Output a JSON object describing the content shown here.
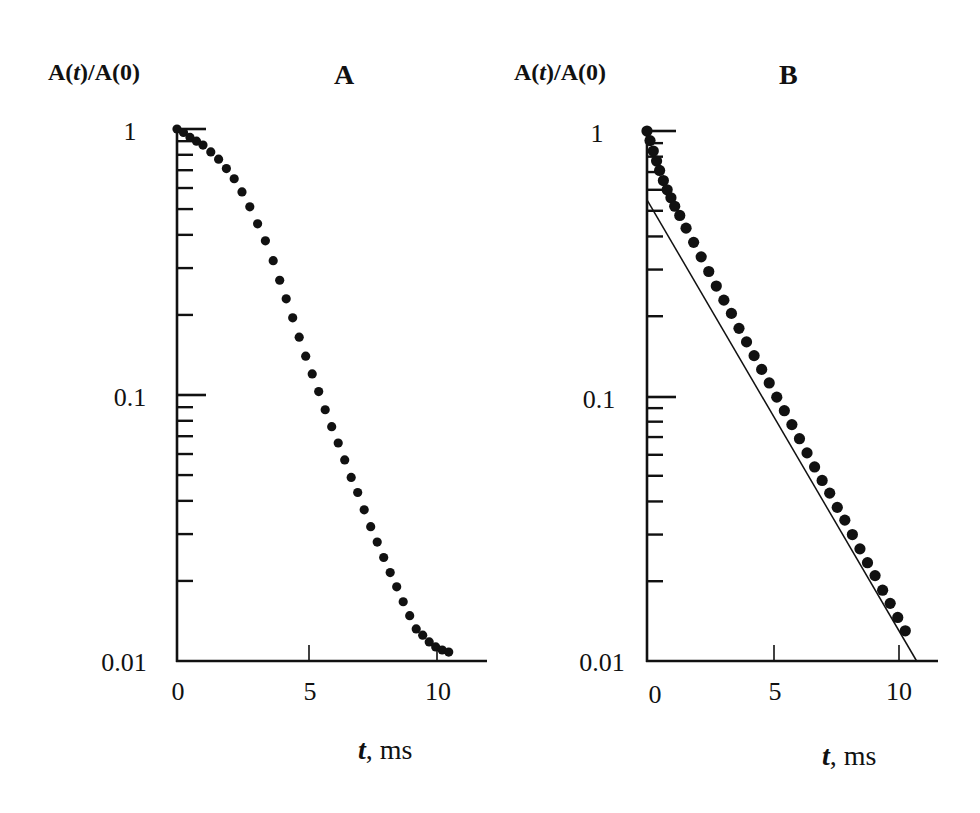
{
  "figure": {
    "panels": [
      {
        "id": "A",
        "title": "A",
        "ylabel_prefix": "A(",
        "ylabel_var": "t",
        "ylabel_suffix": ")/A(0)",
        "xlabel_var": "t",
        "xlabel_unit": ", ms",
        "yticks": [
          "1",
          "0.1",
          "0.01"
        ],
        "xticks": [
          "0",
          "5",
          "10"
        ]
      },
      {
        "id": "B",
        "title": "B",
        "ylabel_prefix": "A(",
        "ylabel_var": "t",
        "ylabel_suffix": ")/A(0)",
        "xlabel_var": "t",
        "xlabel_unit": ", ms",
        "yticks": [
          "1",
          "0.1",
          "0.01"
        ],
        "xticks": [
          "0",
          "5",
          "10"
        ]
      }
    ]
  },
  "chart_data": [
    {
      "type": "scatter",
      "title": "A",
      "xlabel": "t, ms",
      "ylabel": "A(t)/A(0)",
      "yscale": "log",
      "xlim": [
        0,
        11.8
      ],
      "ylim": [
        0.01,
        1
      ],
      "xticks": [
        0,
        5,
        10
      ],
      "yticks": [
        1,
        0.1,
        0.01
      ],
      "grid": false,
      "legend": null,
      "series": [
        {
          "name": "A data",
          "marker": "filled-circle",
          "x": [
            0,
            0.25,
            0.5,
            0.75,
            1.0,
            1.3,
            1.6,
            1.9,
            2.2,
            2.5,
            2.8,
            3.1,
            3.4,
            3.7,
            3.95,
            4.2,
            4.45,
            4.7,
            4.95,
            5.2,
            5.45,
            5.7,
            5.95,
            6.2,
            6.45,
            6.7,
            6.95,
            7.2,
            7.45,
            7.7,
            7.95,
            8.2,
            8.45,
            8.7,
            8.95,
            9.2,
            9.45,
            9.7,
            9.95,
            10.2,
            10.45
          ],
          "y": [
            1.0,
            0.97,
            0.93,
            0.9,
            0.87,
            0.82,
            0.77,
            0.71,
            0.65,
            0.58,
            0.51,
            0.44,
            0.38,
            0.32,
            0.27,
            0.23,
            0.195,
            0.165,
            0.14,
            0.12,
            0.103,
            0.088,
            0.076,
            0.066,
            0.057,
            0.049,
            0.043,
            0.037,
            0.032,
            0.028,
            0.0245,
            0.0215,
            0.019,
            0.0167,
            0.0148,
            0.0132,
            0.0125,
            0.0118,
            0.0113,
            0.011,
            0.0108
          ]
        }
      ]
    },
    {
      "type": "scatter",
      "title": "B",
      "xlabel": "t, ms",
      "ylabel": "A(t)/A(0)",
      "yscale": "log",
      "xlim": [
        0,
        11.6
      ],
      "ylim": [
        0.01,
        1
      ],
      "xticks": [
        0,
        5,
        10
      ],
      "yticks": [
        1,
        0.1,
        0.01
      ],
      "grid": false,
      "legend": null,
      "series": [
        {
          "name": "B data",
          "marker": "filled-circle",
          "x": [
            0,
            0.12,
            0.25,
            0.38,
            0.5,
            0.65,
            0.8,
            0.95,
            1.1,
            1.3,
            1.55,
            1.85,
            2.15,
            2.45,
            2.75,
            3.05,
            3.35,
            3.65,
            3.95,
            4.25,
            4.55,
            4.85,
            5.15,
            5.45,
            5.75,
            6.05,
            6.35,
            6.65,
            6.95,
            7.25,
            7.55,
            7.85,
            8.15,
            8.45,
            8.75,
            9.05,
            9.35,
            9.65,
            9.95,
            10.25
          ],
          "y": [
            1.0,
            0.92,
            0.84,
            0.77,
            0.71,
            0.65,
            0.6,
            0.56,
            0.52,
            0.48,
            0.43,
            0.38,
            0.335,
            0.295,
            0.26,
            0.23,
            0.205,
            0.18,
            0.16,
            0.142,
            0.126,
            0.112,
            0.099,
            0.088,
            0.078,
            0.069,
            0.061,
            0.054,
            0.048,
            0.043,
            0.038,
            0.034,
            0.03,
            0.0265,
            0.0235,
            0.021,
            0.0185,
            0.0165,
            0.0146,
            0.013
          ]
        },
        {
          "name": "B fit line",
          "marker": "none",
          "line": "solid",
          "x": [
            0,
            10.7
          ],
          "y": [
            0.55,
            0.01
          ]
        }
      ]
    }
  ]
}
